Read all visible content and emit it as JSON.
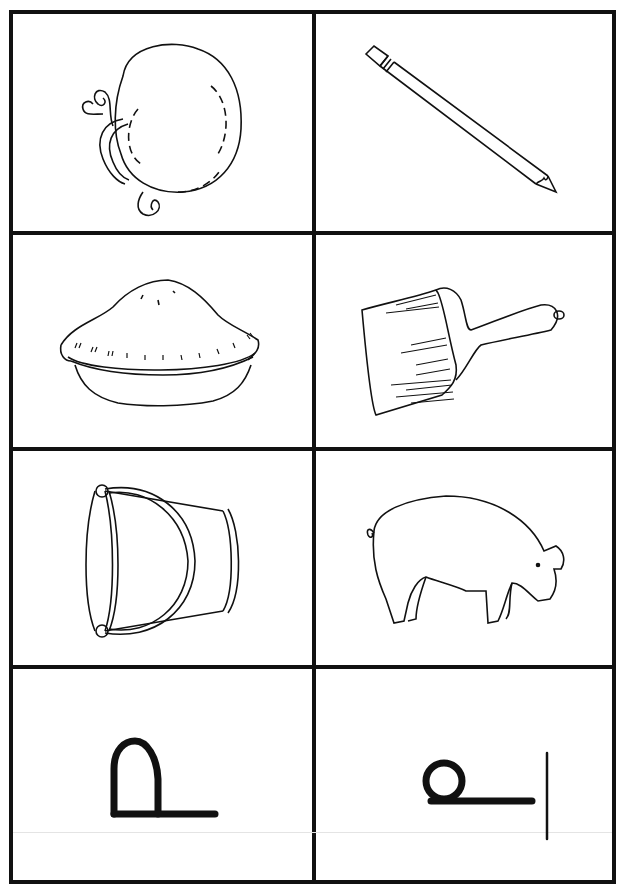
{
  "worksheet": {
    "layout": {
      "rows": 4,
      "columns": 2
    },
    "cells": [
      {
        "row": 1,
        "col": 1,
        "picture": "pumpkin"
      },
      {
        "row": 1,
        "col": 2,
        "picture": "pencil"
      },
      {
        "row": 2,
        "col": 1,
        "picture": "pie"
      },
      {
        "row": 2,
        "col": 2,
        "picture": "paintbrush"
      },
      {
        "row": 3,
        "col": 1,
        "picture": "pail"
      },
      {
        "row": 3,
        "col": 2,
        "picture": "pig"
      },
      {
        "row": 4,
        "col": 1,
        "picture": "handwriting-glyph-arch-on-baseline"
      },
      {
        "row": 4,
        "col": 2,
        "picture": "handwriting-glyph-loop-on-baseline-with-vertical-line"
      }
    ],
    "colors": {
      "ink": "#111111",
      "paper": "#ffffff"
    }
  }
}
